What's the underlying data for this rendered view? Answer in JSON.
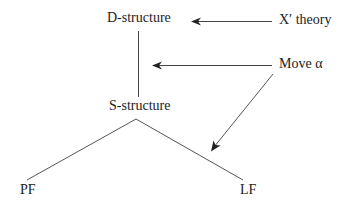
{
  "diagram": {
    "nodes": {
      "d_structure": "D-structure",
      "s_structure": "S-structure",
      "pf": "PF",
      "lf": "LF",
      "x_bar_theory": "X′ theory",
      "move_alpha": "Move α"
    },
    "edges": [
      {
        "from": "D-structure",
        "to": "S-structure",
        "type": "line"
      },
      {
        "from": "S-structure",
        "to": "PF",
        "type": "line"
      },
      {
        "from": "S-structure",
        "to": "LF",
        "type": "line"
      },
      {
        "from": "X′ theory",
        "to": "D-structure",
        "type": "arrow"
      },
      {
        "from": "Move α",
        "to": "D-structure→S-structure",
        "type": "arrow"
      },
      {
        "from": "Move α",
        "to": "S-structure→LF",
        "type": "arrow"
      }
    ],
    "colors": {
      "stroke": "#333333",
      "text": "#222222",
      "background": "#ffffff"
    }
  }
}
